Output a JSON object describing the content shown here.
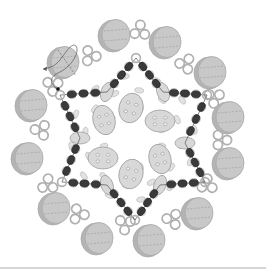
{
  "diagram": {
    "center": [
      133,
      138
    ],
    "colors": {
      "background": "#ffffff",
      "coin_fill": "#c8c8c8",
      "coin_shade": "#b4b4b4",
      "coin_stroke": "#a8a8a8",
      "ring_stroke": "#b0b0b0",
      "dark_bead": "#3a3a3a",
      "dark_bead_stroke": "#1e1e1e",
      "oval_fill": "#d8d8d8",
      "oval_stroke": "#a0a0a0",
      "rice_fill": "#e2e2e2",
      "rice_stroke": "#bdbdbd",
      "thread": "#555555",
      "divider": "#d6d6d6"
    },
    "coin_beads": [
      {
        "x": 115,
        "y": 35
      },
      {
        "x": 166,
        "y": 42
      },
      {
        "x": 211,
        "y": 72
      },
      {
        "x": 229,
        "y": 117
      },
      {
        "x": 229,
        "y": 163
      },
      {
        "x": 198,
        "y": 213
      },
      {
        "x": 150,
        "y": 240
      },
      {
        "x": 98,
        "y": 238
      },
      {
        "x": 55,
        "y": 208
      },
      {
        "x": 28,
        "y": 158
      },
      {
        "x": 32,
        "y": 105
      },
      {
        "x": 64,
        "y": 62
      }
    ],
    "ring_clusters": [
      {
        "x": 90,
        "y": 55
      },
      {
        "x": 140,
        "y": 30
      },
      {
        "x": 186,
        "y": 63
      },
      {
        "x": 215,
        "y": 97
      },
      {
        "x": 222,
        "y": 140
      },
      {
        "x": 208,
        "y": 185
      },
      {
        "x": 173,
        "y": 220
      },
      {
        "x": 125,
        "y": 225
      },
      {
        "x": 78,
        "y": 215
      },
      {
        "x": 47,
        "y": 185
      },
      {
        "x": 40,
        "y": 130
      },
      {
        "x": 52,
        "y": 85
      }
    ],
    "star": {
      "points": [
        {
          "x": 136,
          "y": 58
        },
        {
          "x": 163,
          "y": 92
        },
        {
          "x": 207,
          "y": 95
        },
        {
          "x": 185,
          "y": 143
        },
        {
          "x": 205,
          "y": 182
        },
        {
          "x": 160,
          "y": 185
        },
        {
          "x": 135,
          "y": 220
        },
        {
          "x": 107,
          "y": 185
        },
        {
          "x": 62,
          "y": 182
        },
        {
          "x": 80,
          "y": 138
        },
        {
          "x": 60,
          "y": 95
        },
        {
          "x": 107,
          "y": 92
        }
      ],
      "beads_per_edge": 3
    },
    "inner_ovals": [
      {
        "x": 131,
        "y": 108,
        "rx": 12,
        "ry": 15,
        "rot": 15
      },
      {
        "x": 160,
        "y": 121,
        "rx": 15,
        "ry": 11,
        "rot": 0
      },
      {
        "x": 160,
        "y": 159,
        "rx": 11,
        "ry": 15,
        "rot": -15
      },
      {
        "x": 131,
        "y": 174,
        "rx": 12,
        "ry": 15,
        "rot": 15
      },
      {
        "x": 103,
        "y": 158,
        "rx": 15,
        "ry": 11,
        "rot": 0
      },
      {
        "x": 104,
        "y": 120,
        "rx": 11,
        "ry": 15,
        "rot": -15
      }
    ],
    "vertex_ovals": [
      {
        "x": 107,
        "y": 92,
        "rot": 20
      },
      {
        "x": 163,
        "y": 92,
        "rot": -20
      },
      {
        "x": 185,
        "y": 143,
        "rot": 90
      },
      {
        "x": 160,
        "y": 185,
        "rot": 20
      },
      {
        "x": 107,
        "y": 185,
        "rot": -20
      },
      {
        "x": 80,
        "y": 138,
        "rot": 90
      }
    ],
    "thread": {
      "arrow_end": {
        "x": 43,
        "y": 69
      },
      "start_dot": {
        "x": 58,
        "y": 89
      }
    },
    "divider_y": 267
  }
}
